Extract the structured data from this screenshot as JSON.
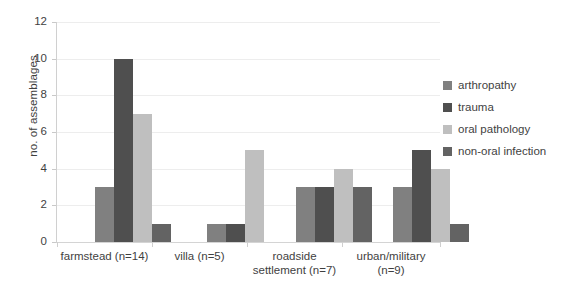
{
  "chart_data": {
    "type": "bar",
    "title": "",
    "xlabel": "",
    "ylabel": "no. of assemblages",
    "ylim": [
      0,
      12
    ],
    "ytick_labels": [
      "12",
      "10",
      "8",
      "6",
      "4",
      "2",
      "0"
    ],
    "ytick_values": [
      12,
      10,
      8,
      6,
      4,
      2,
      0
    ],
    "grid": true,
    "legend_position": "right",
    "categories": [
      "farmstead (n=14)",
      "villa (n=5)",
      "roadside settlement (n=7)",
      "urban/military (n=9)"
    ],
    "category_lines": [
      [
        "farmstead (n=14)"
      ],
      [
        "villa (n=5)"
      ],
      [
        "roadside",
        "settlement (n=7)"
      ],
      [
        "urban/military",
        "(n=9)"
      ]
    ],
    "series": [
      {
        "name": "arthropathy",
        "color": "#808080",
        "values": [
          3,
          1,
          3,
          3
        ]
      },
      {
        "name": "trauma",
        "color": "#4f4f4f",
        "values": [
          10,
          1,
          3,
          5
        ]
      },
      {
        "name": "oral pathology",
        "color": "#bfbfbf",
        "values": [
          7,
          5,
          4,
          4
        ]
      },
      {
        "name": "non-oral infection",
        "color": "#636363",
        "values": [
          1,
          0,
          3,
          1
        ]
      }
    ]
  },
  "legend": {
    "items": [
      {
        "label": "arthropathy",
        "color": "#808080"
      },
      {
        "label": "trauma",
        "color": "#4f4f4f"
      },
      {
        "label": "oral pathology",
        "color": "#bfbfbf"
      },
      {
        "label": "non-oral infection",
        "color": "#636363"
      }
    ]
  },
  "colors": {
    "background": "#ffffff",
    "gridline": "#ededed",
    "axis": "#d0d0d0",
    "text": "#3f3f3f"
  }
}
